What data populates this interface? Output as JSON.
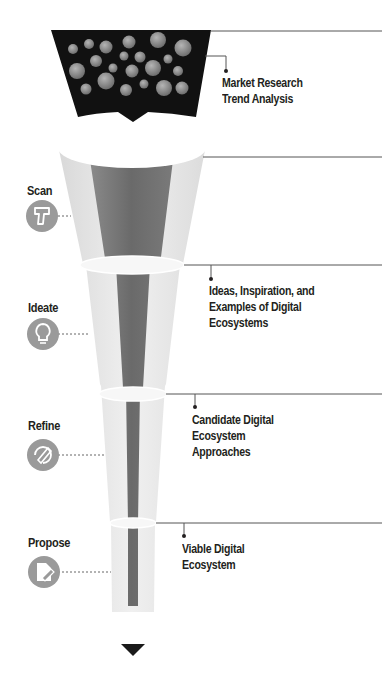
{
  "header": {
    "cut_off_title": "Ecosystem"
  },
  "stages": [
    {
      "label": "Scan",
      "icon": "barcode-scanner-icon"
    },
    {
      "label": "Ideate",
      "icon": "lightbulb-icon"
    },
    {
      "label": "Refine",
      "icon": "refine-pen-icon"
    },
    {
      "label": "Propose",
      "icon": "document-pen-icon"
    }
  ],
  "outputs": [
    {
      "lines": [
        "Market Research",
        "Trend Analysis"
      ]
    },
    {
      "lines": [
        "Ideas, Inspiration, and",
        "Examples of Digital",
        "Ecosystems"
      ]
    },
    {
      "lines": [
        "Candidate Digital",
        "Ecosystem",
        "Approaches"
      ]
    },
    {
      "lines": [
        "Viable Digital",
        "Ecosystem"
      ]
    }
  ],
  "colors": {
    "funnel_top": "#111111",
    "bubble": "#8a8a8a",
    "funnel_body": "#e6e6e6",
    "core": "#6d6d6d",
    "icon_circle": "#9a9a9a",
    "text": "#231f20",
    "line": "#555555"
  }
}
